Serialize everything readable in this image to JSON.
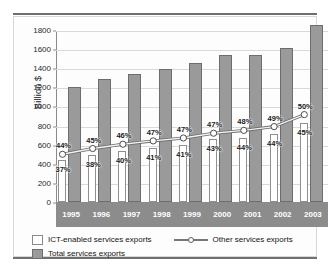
{
  "chart_data": {
    "type": "bar",
    "title": "",
    "subtitle": "",
    "xlabel": "",
    "ylabel": "Billion $",
    "ylim": [
      0,
      1800
    ],
    "ytick_step": 200,
    "grid": true,
    "legend_position": "bottom",
    "categories": [
      "1995",
      "1996",
      "1997",
      "1998",
      "1999",
      "2000",
      "2001",
      "2002",
      "2003"
    ],
    "yticks": [
      "0",
      "200",
      "400",
      "600",
      "800",
      "1000",
      "1200",
      "1400",
      "1600",
      "1800"
    ],
    "series": [
      {
        "name": "Total services exports",
        "render": "bar",
        "color": "#9a9a9a",
        "values": [
          1200,
          1290,
          1340,
          1390,
          1450,
          1535,
          1535,
          1615,
          1850
        ]
      },
      {
        "name": "ICT-enabled services exports",
        "render": "bar",
        "color": "#ffffff",
        "values": [
          440,
          490,
          535,
          570,
          595,
          660,
          675,
          710,
          830
        ],
        "data_labels": [
          "37%",
          "38%",
          "40%",
          "41%",
          "41%",
          "43%",
          "44%",
          "44%",
          "45%"
        ]
      },
      {
        "name": "Other services exports",
        "render": "line",
        "color": "#ffffff",
        "values": [
          510,
          570,
          615,
          650,
          680,
          730,
          760,
          800,
          925
        ],
        "data_labels": [
          "44%",
          "45%",
          "46%",
          "47%",
          "47%",
          "47%",
          "48%",
          "49%",
          "50%"
        ]
      }
    ]
  },
  "legend": {
    "ict_label": "ICT-enabled services exports",
    "other_label": "Other services exports",
    "total_label": "Total services exports"
  }
}
